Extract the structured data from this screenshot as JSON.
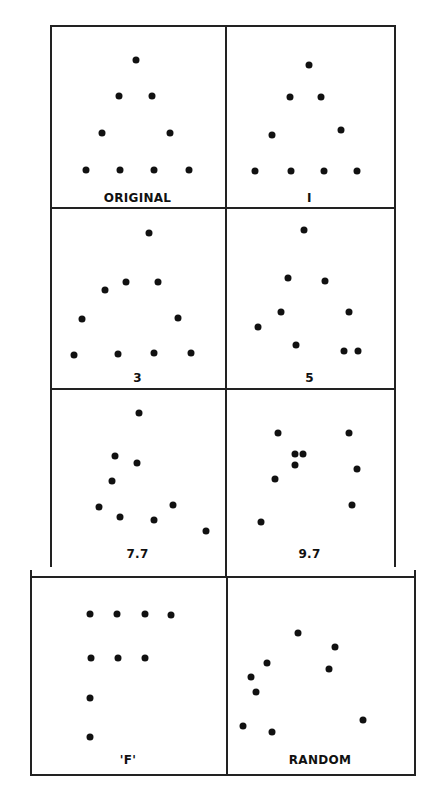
{
  "figure": {
    "panels": [
      {
        "label": "ORIGINAL",
        "x": 50,
        "y": 25,
        "w": 175,
        "h": 183,
        "label_y": 166,
        "dots": [
          [
            86,
            35
          ],
          [
            69,
            71
          ],
          [
            102,
            71
          ],
          [
            52,
            108
          ],
          [
            120,
            108
          ],
          [
            36,
            145
          ],
          [
            70,
            145
          ],
          [
            104,
            145
          ],
          [
            139,
            145
          ]
        ]
      },
      {
        "label": "I",
        "x": 225,
        "y": 25,
        "w": 169,
        "h": 183,
        "label_y": 166,
        "dots": [
          [
            84,
            40
          ],
          [
            65,
            72
          ],
          [
            96,
            72
          ],
          [
            47,
            110
          ],
          [
            116,
            105
          ],
          [
            30,
            146
          ],
          [
            66,
            146
          ],
          [
            99,
            146
          ],
          [
            132,
            146
          ]
        ]
      },
      {
        "label": "3",
        "x": 50,
        "y": 208,
        "w": 175,
        "h": 181,
        "label_y": 163,
        "dots": [
          [
            99,
            25
          ],
          [
            76,
            74
          ],
          [
            55,
            82
          ],
          [
            108,
            74
          ],
          [
            32,
            111
          ],
          [
            128,
            110
          ],
          [
            24,
            147
          ],
          [
            68,
            146
          ],
          [
            104,
            145
          ],
          [
            141,
            145
          ]
        ]
      },
      {
        "label": "5",
        "x": 225,
        "y": 208,
        "w": 169,
        "h": 181,
        "label_y": 163,
        "dots": [
          [
            79,
            22
          ],
          [
            63,
            70
          ],
          [
            100,
            73
          ],
          [
            56,
            104
          ],
          [
            124,
            104
          ],
          [
            33,
            119
          ],
          [
            71,
            137
          ],
          [
            119,
            143
          ],
          [
            133,
            143
          ]
        ]
      },
      {
        "label": "7.7",
        "x": 50,
        "y": 389,
        "w": 175,
        "h": 178,
        "label_y": 158,
        "dots": [
          [
            89,
            24
          ],
          [
            65,
            67
          ],
          [
            87,
            74
          ],
          [
            62,
            92
          ],
          [
            49,
            118
          ],
          [
            70,
            128
          ],
          [
            123,
            116
          ],
          [
            104,
            131
          ],
          [
            156,
            142
          ]
        ]
      },
      {
        "label": "9.7",
        "x": 225,
        "y": 389,
        "w": 169,
        "h": 178,
        "label_y": 158,
        "dots": [
          [
            53,
            44
          ],
          [
            124,
            44
          ],
          [
            70,
            65
          ],
          [
            78,
            65
          ],
          [
            70,
            76
          ],
          [
            50,
            90
          ],
          [
            132,
            80
          ],
          [
            127,
            116
          ],
          [
            36,
            133
          ]
        ]
      },
      {
        "label": "'F'",
        "x": 30,
        "y": 576,
        "w": 196,
        "h": 199,
        "label_y": 177,
        "dots": [
          [
            60,
            38
          ],
          [
            87,
            38
          ],
          [
            115,
            38
          ],
          [
            141,
            39
          ],
          [
            61,
            82
          ],
          [
            88,
            82
          ],
          [
            115,
            82
          ],
          [
            60,
            122
          ],
          [
            60,
            161
          ]
        ]
      },
      {
        "label": "RANDOM",
        "x": 226,
        "y": 576,
        "w": 188,
        "h": 199,
        "label_y": 177,
        "dots": [
          [
            72,
            57
          ],
          [
            109,
            71
          ],
          [
            41,
            87
          ],
          [
            25,
            101
          ],
          [
            103,
            93
          ],
          [
            30,
            116
          ],
          [
            17,
            150
          ],
          [
            46,
            156
          ],
          [
            137,
            144
          ]
        ]
      }
    ]
  },
  "chart_data": {
    "type": "scatter",
    "title": "",
    "panels": [
      {
        "label": "ORIGINAL",
        "points": [
          [
            86,
            35
          ],
          [
            69,
            71
          ],
          [
            102,
            71
          ],
          [
            52,
            108
          ],
          [
            120,
            108
          ],
          [
            36,
            145
          ],
          [
            70,
            145
          ],
          [
            104,
            145
          ],
          [
            139,
            145
          ]
        ]
      },
      {
        "label": "I",
        "points": [
          [
            84,
            40
          ],
          [
            65,
            72
          ],
          [
            96,
            72
          ],
          [
            47,
            110
          ],
          [
            116,
            105
          ],
          [
            30,
            146
          ],
          [
            66,
            146
          ],
          [
            99,
            146
          ],
          [
            132,
            146
          ]
        ]
      },
      {
        "label": "3",
        "points": [
          [
            99,
            25
          ],
          [
            76,
            74
          ],
          [
            55,
            82
          ],
          [
            108,
            74
          ],
          [
            32,
            111
          ],
          [
            128,
            110
          ],
          [
            24,
            147
          ],
          [
            68,
            146
          ],
          [
            104,
            145
          ],
          [
            141,
            145
          ]
        ]
      },
      {
        "label": "5",
        "points": [
          [
            79,
            22
          ],
          [
            63,
            70
          ],
          [
            100,
            73
          ],
          [
            56,
            104
          ],
          [
            124,
            104
          ],
          [
            33,
            119
          ],
          [
            71,
            137
          ],
          [
            119,
            143
          ],
          [
            133,
            143
          ]
        ]
      },
      {
        "label": "7.7",
        "points": [
          [
            89,
            24
          ],
          [
            65,
            67
          ],
          [
            87,
            74
          ],
          [
            62,
            92
          ],
          [
            49,
            118
          ],
          [
            70,
            128
          ],
          [
            123,
            116
          ],
          [
            104,
            131
          ],
          [
            156,
            142
          ]
        ]
      },
      {
        "label": "9.7",
        "points": [
          [
            53,
            44
          ],
          [
            124,
            44
          ],
          [
            70,
            65
          ],
          [
            78,
            65
          ],
          [
            70,
            76
          ],
          [
            50,
            90
          ],
          [
            132,
            80
          ],
          [
            127,
            116
          ],
          [
            36,
            133
          ]
        ]
      },
      {
        "label": "'F'",
        "points": [
          [
            60,
            38
          ],
          [
            87,
            38
          ],
          [
            115,
            38
          ],
          [
            141,
            39
          ],
          [
            61,
            82
          ],
          [
            88,
            82
          ],
          [
            115,
            82
          ],
          [
            60,
            122
          ],
          [
            60,
            161
          ]
        ]
      },
      {
        "label": "RANDOM",
        "points": [
          [
            72,
            57
          ],
          [
            109,
            71
          ],
          [
            41,
            87
          ],
          [
            25,
            101
          ],
          [
            103,
            93
          ],
          [
            30,
            116
          ],
          [
            17,
            150
          ],
          [
            46,
            156
          ],
          [
            137,
            144
          ]
        ]
      }
    ],
    "xlabel": "",
    "ylabel": "",
    "grid": false,
    "legend": "none"
  }
}
